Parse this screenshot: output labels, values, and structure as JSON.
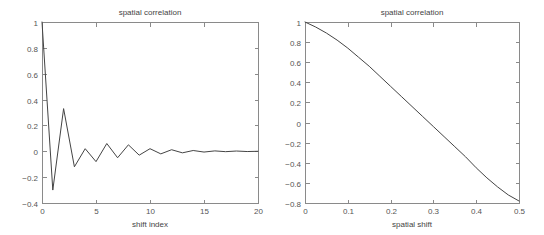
{
  "figure": {
    "background_color": "#ffffff",
    "axis_color": "#8a8a8a",
    "line_color": "#444444",
    "text_color": "#555555"
  },
  "panels": {
    "left": {
      "title": "spatial correlation",
      "xlabel": "shift index",
      "ylabel": "",
      "xticks": [
        "0",
        "5",
        "10",
        "15",
        "20"
      ],
      "yticks": [
        "-0.4",
        "-0.2",
        "0",
        "0.2",
        "0.4",
        "0.6",
        "0.8",
        "1"
      ]
    },
    "right": {
      "title": "spatial correlation",
      "xlabel": "spatial shift",
      "ylabel": "",
      "xticks": [
        "0",
        "0.1",
        "0.2",
        "0.3",
        "0.4",
        "0.5"
      ],
      "yticks": [
        "-0.8",
        "-0.6",
        "-0.4",
        "-0.2",
        "0",
        "0.2",
        "0.4",
        "0.6",
        "0.8",
        "1"
      ]
    }
  },
  "chart_data": [
    {
      "type": "line",
      "panel": "left",
      "title": "spatial correlation",
      "xlabel": "shift index",
      "ylabel": "",
      "xlim": [
        0,
        20
      ],
      "ylim": [
        -0.4,
        1
      ],
      "xticks": [
        0,
        5,
        10,
        15,
        20
      ],
      "yticks": [
        -0.4,
        -0.2,
        0,
        0.2,
        0.4,
        0.6,
        0.8,
        1
      ],
      "grid": false,
      "legend": "none",
      "x": [
        0,
        1,
        2,
        3,
        4,
        5,
        6,
        7,
        8,
        9,
        10,
        11,
        12,
        13,
        14,
        15,
        16,
        17,
        18,
        19,
        20
      ],
      "values": [
        1.0,
        -0.3,
        0.33,
        -0.12,
        0.02,
        -0.08,
        0.06,
        -0.05,
        0.05,
        -0.03,
        0.02,
        -0.02,
        0.012,
        -0.012,
        0.006,
        -0.006,
        0.003,
        -0.003,
        0.002,
        -0.002,
        0.0
      ]
    },
    {
      "type": "line",
      "panel": "right",
      "title": "spatial correlation",
      "xlabel": "spatial shift",
      "ylabel": "",
      "xlim": [
        0,
        0.5
      ],
      "ylim": [
        -0.8,
        1
      ],
      "xticks": [
        0,
        0.1,
        0.2,
        0.3,
        0.4,
        0.5
      ],
      "yticks": [
        -0.8,
        -0.6,
        -0.4,
        -0.2,
        0,
        0.2,
        0.4,
        0.6,
        0.8,
        1
      ],
      "grid": false,
      "legend": "none",
      "x": [
        0,
        0.025,
        0.05,
        0.075,
        0.1,
        0.125,
        0.15,
        0.175,
        0.2,
        0.225,
        0.25,
        0.275,
        0.3,
        0.325,
        0.35,
        0.375,
        0.4,
        0.425,
        0.45,
        0.475,
        0.5
      ],
      "values": [
        1.0,
        0.95,
        0.89,
        0.82,
        0.74,
        0.65,
        0.56,
        0.46,
        0.36,
        0.26,
        0.16,
        0.06,
        -0.04,
        -0.14,
        -0.24,
        -0.34,
        -0.45,
        -0.55,
        -0.64,
        -0.72,
        -0.78
      ]
    }
  ]
}
